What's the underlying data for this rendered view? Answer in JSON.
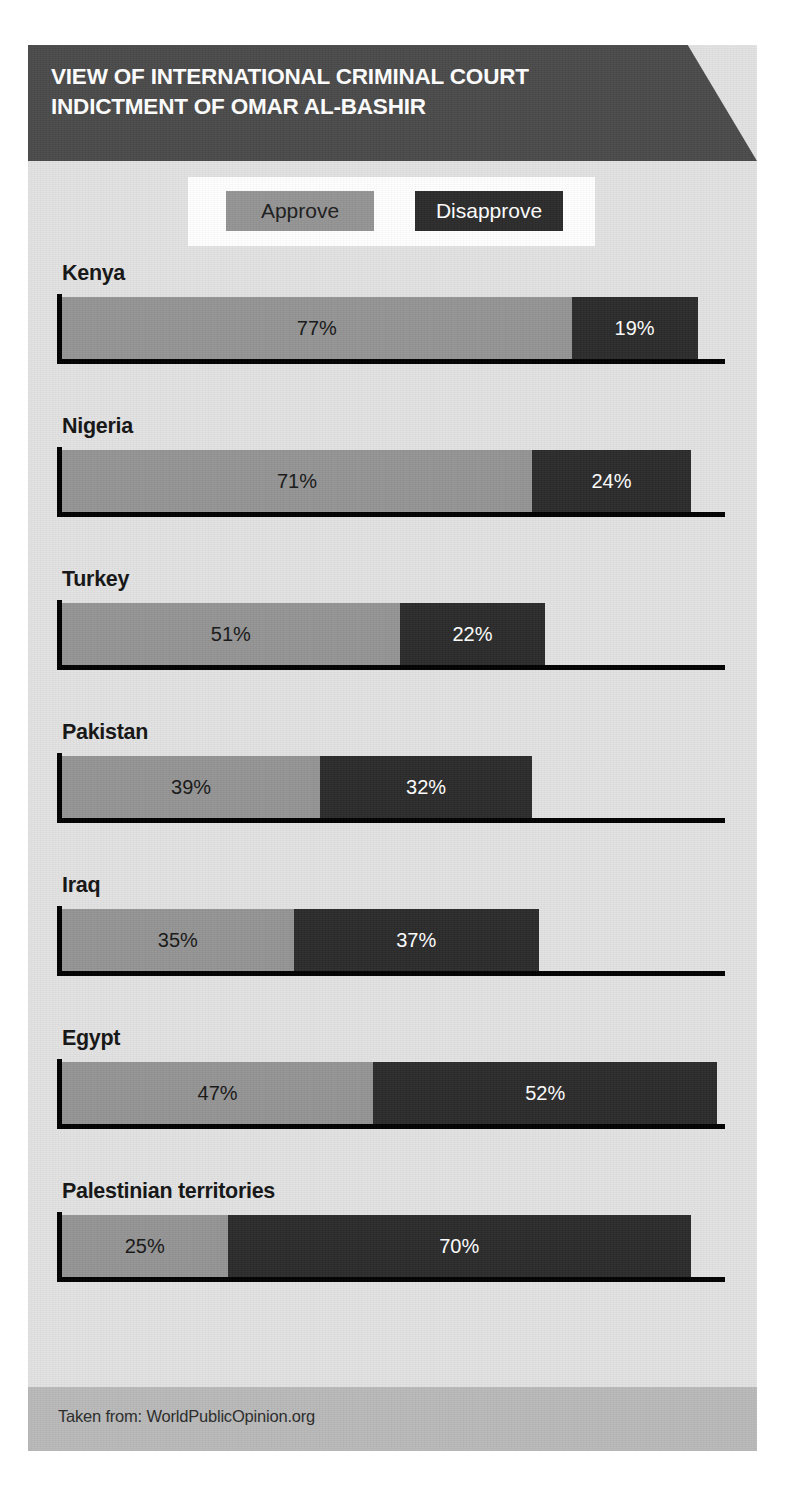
{
  "header": {
    "title": "VIEW OF INTERNATIONAL CRIMINAL COURT\nINDICTMENT OF OMAR AL-BASHIR"
  },
  "legend": {
    "approve_label": "Approve",
    "disapprove_label": "Disapprove"
  },
  "footer": {
    "source_text": "Taken from: WorldPublicOpinion.org"
  },
  "colors": {
    "approve": "#949494",
    "disapprove": "#2b2b2b",
    "header_band": "#4a4a4a",
    "panel_background": "#e2e2e2",
    "footer_band": "#b9b9b9",
    "legend_background": "#ffffff",
    "axis": "#000000"
  },
  "chart_data": {
    "type": "bar",
    "title": "VIEW OF INTERNATIONAL CRIMINAL COURT INDICTMENT OF OMAR AL-BASHIR",
    "subtitle": "",
    "xlabel": "",
    "ylabel": "",
    "orientation": "horizontal",
    "stacked": true,
    "grid": false,
    "legend_position": "top",
    "xlim": [
      0,
      100
    ],
    "value_suffix": "%",
    "source": "Taken from: WorldPublicOpinion.org",
    "categories": [
      "Kenya",
      "Nigeria",
      "Turkey",
      "Pakistan",
      "Iraq",
      "Egypt",
      "Palestinian territories"
    ],
    "series": [
      {
        "name": "Approve",
        "color": "#949494",
        "values": [
          77,
          71,
          51,
          39,
          35,
          47,
          25
        ]
      },
      {
        "name": "Disapprove",
        "color": "#2b2b2b",
        "values": [
          19,
          24,
          22,
          32,
          37,
          52,
          70
        ]
      }
    ],
    "rows": [
      {
        "category": "Kenya",
        "approve": 77,
        "disapprove": 19,
        "approve_label": "77%",
        "disapprove_label": "19%"
      },
      {
        "category": "Nigeria",
        "approve": 71,
        "disapprove": 24,
        "approve_label": "71%",
        "disapprove_label": "24%"
      },
      {
        "category": "Turkey",
        "approve": 51,
        "disapprove": 22,
        "approve_label": "51%",
        "disapprove_label": "22%"
      },
      {
        "category": "Pakistan",
        "approve": 39,
        "disapprove": 32,
        "approve_label": "39%",
        "disapprove_label": "32%"
      },
      {
        "category": "Iraq",
        "approve": 35,
        "disapprove": 37,
        "approve_label": "35%",
        "disapprove_label": "37%"
      },
      {
        "category": "Egypt",
        "approve": 47,
        "disapprove": 52,
        "approve_label": "47%",
        "disapprove_label": "52%"
      },
      {
        "category": "Palestinian territories",
        "approve": 25,
        "disapprove": 70,
        "approve_label": "25%",
        "disapprove_label": "70%"
      }
    ]
  }
}
